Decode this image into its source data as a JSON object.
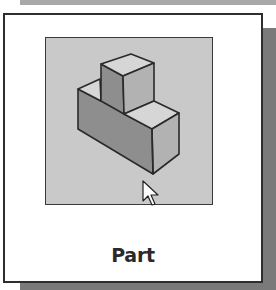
{
  "tile": {
    "label": "Part",
    "icon": "isometric-part-icon",
    "selected": false,
    "hovered": true
  },
  "colors": {
    "preview_background": "#c9c9c9",
    "face_top": "#d6d6d6",
    "face_left": "#8e8e8e",
    "face_right": "#b2b2b2",
    "outline": "#2a2a2a",
    "shadow": "#7a7a7a",
    "label": "#2a2a2a"
  },
  "cursor": {
    "type": "arrow-pointer-icon",
    "x": 143,
    "y": 181
  }
}
